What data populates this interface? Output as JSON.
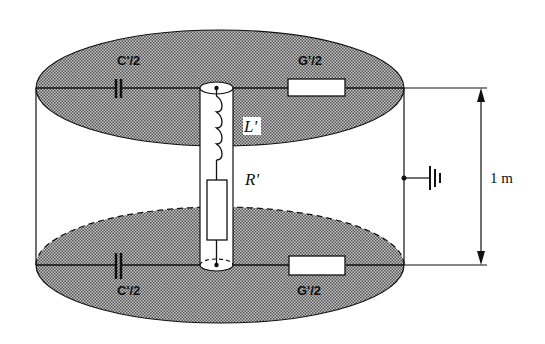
{
  "diagram": {
    "type": "equivalent-circuit",
    "labels": {
      "capacitance_top": "C'/2",
      "conductance_top": "G'/2",
      "inductance": "L'",
      "resistance": "R'",
      "capacitance_bottom": "C'/2",
      "conductance_bottom": "G'/2",
      "length": "1 m"
    },
    "components": [
      {
        "id": "cap-top",
        "kind": "capacitor",
        "label": "C'/2"
      },
      {
        "id": "res-top",
        "kind": "resistor",
        "label": "G'/2"
      },
      {
        "id": "inductor",
        "kind": "inductor",
        "label": "L'"
      },
      {
        "id": "res-series",
        "kind": "resistor",
        "label": "R'"
      },
      {
        "id": "cap-bottom",
        "kind": "capacitor",
        "label": "C'/2"
      },
      {
        "id": "res-bottom",
        "kind": "resistor",
        "label": "G'/2"
      },
      {
        "id": "ground",
        "kind": "ground",
        "label": ""
      }
    ],
    "colors": {
      "line": "#111111",
      "disc_fill": "#9a9a9a",
      "background": "#ffffff"
    }
  }
}
